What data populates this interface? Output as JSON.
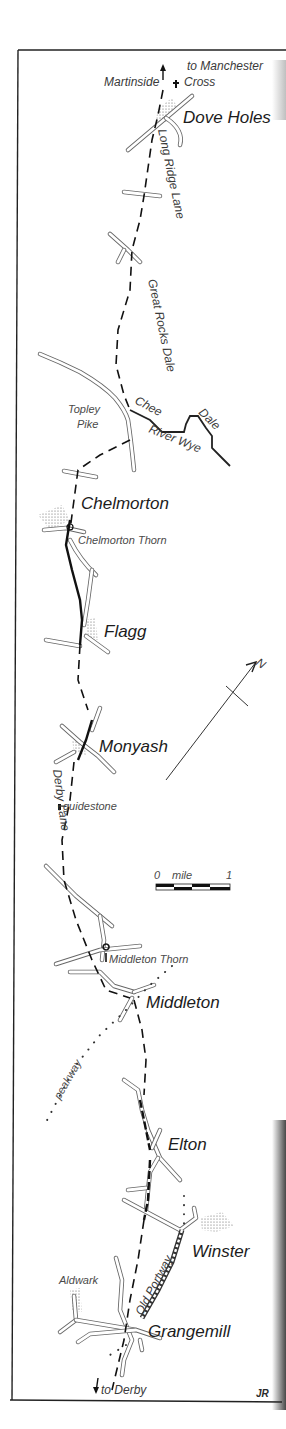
{
  "map": {
    "title_labels": {
      "to_manchester": "to Manchester",
      "martinside_cross_left": "Martinside",
      "martinside_cross_right": "Cross",
      "dove_holes": "Dove Holes",
      "long_ridge_lane": "Long Ridge Lane",
      "great_rocks_dale": "Great Rocks Dale",
      "topley_pike_1": "Topley",
      "topley_pike_2": "Pike",
      "chee": "Chee",
      "dale": "Dale",
      "river_wye": "River Wye",
      "chelmorton": "Chelmorton",
      "chelmorton_thorn": "Chelmorton Thorn",
      "flagg": "Flagg",
      "monyash": "Monyash",
      "derby_lane": "Derby Lane",
      "guidestone": "guidestone",
      "middleton_thorn": "Middleton Thorn",
      "middleton": "Middleton",
      "peakway": "peakway",
      "elton": "Elton",
      "winster": "Winster",
      "old_portway": "Old Portway",
      "aldwark": "Aldwark",
      "grangemill": "Grangemill",
      "to_derby": "to Derby",
      "signature": "JR"
    },
    "compass": {
      "label": "N"
    },
    "scale_bar": {
      "start": "0",
      "unit": "mile",
      "end": "1"
    },
    "colors": {
      "ink": "#111111",
      "paper": "#ffffff",
      "road": "#555555"
    }
  }
}
